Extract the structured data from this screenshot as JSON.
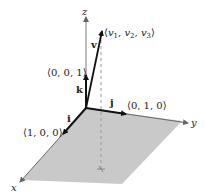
{
  "diagram": {
    "type": "3d-coordinate-system",
    "axes": {
      "x_label": "x",
      "y_label": "y",
      "z_label": "z"
    },
    "unit_vectors": [
      {
        "name": "i",
        "label": "⟨1, 0, 0⟩"
      },
      {
        "name": "j",
        "label": "⟨0, 1, 0⟩"
      },
      {
        "name": "k",
        "label": "⟨0, 0, 1⟩"
      }
    ],
    "vector": {
      "name": "v",
      "label_open": "⟨",
      "comp1": "v",
      "sub1": "1",
      "comp2": "v",
      "sub2": "2",
      "comp3": "v",
      "sub3": "3",
      "label_close": "⟩"
    },
    "colors": {
      "plane_fill": "#c9c9c9",
      "axis_line": "#777777",
      "vector_line": "#111111",
      "dashed_projection": "#9a9a9a",
      "background": "#ffffff"
    }
  }
}
